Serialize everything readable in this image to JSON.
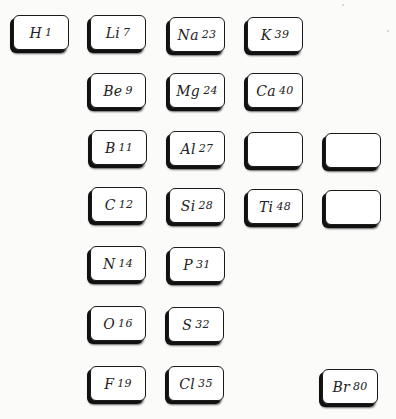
{
  "cells": [
    {
      "symbol": "H",
      "weight": "1"
    },
    {
      "symbol": "Li",
      "weight": "7"
    },
    {
      "symbol": "Na",
      "weight": "23"
    },
    {
      "symbol": "K",
      "weight": "39"
    },
    {
      "symbol": "Be",
      "weight": "9"
    },
    {
      "symbol": "Mg",
      "weight": "24"
    },
    {
      "symbol": "Ca",
      "weight": "40"
    },
    {
      "symbol": "B",
      "weight": "11"
    },
    {
      "symbol": "Al",
      "weight": "27"
    },
    {
      "symbol": "",
      "weight": ""
    },
    {
      "symbol": "",
      "weight": ""
    },
    {
      "symbol": "C",
      "weight": "12"
    },
    {
      "symbol": "Si",
      "weight": "28"
    },
    {
      "symbol": "Ti",
      "weight": "48"
    },
    {
      "symbol": "",
      "weight": ""
    },
    {
      "symbol": "N",
      "weight": "14"
    },
    {
      "symbol": "P",
      "weight": "31"
    },
    {
      "symbol": "O",
      "weight": "16"
    },
    {
      "symbol": "S",
      "weight": "32"
    },
    {
      "symbol": "F",
      "weight": "19"
    },
    {
      "symbol": "Cl",
      "weight": "35"
    },
    {
      "symbol": "Br",
      "weight": "80"
    }
  ]
}
